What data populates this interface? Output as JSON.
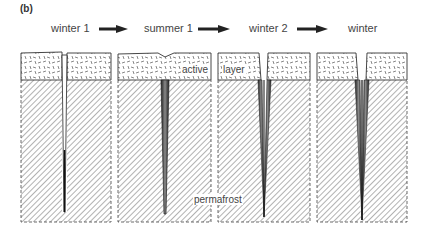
{
  "figure": {
    "panel_label": "(b)",
    "stages": [
      {
        "label": "winter 1"
      },
      {
        "label": "summer 1"
      },
      {
        "label": "winter 2"
      },
      {
        "label": "winter"
      }
    ],
    "annotations": {
      "active_layer_part1": "active",
      "active_layer_part2": "layer",
      "permafrost": "permafrost"
    }
  }
}
